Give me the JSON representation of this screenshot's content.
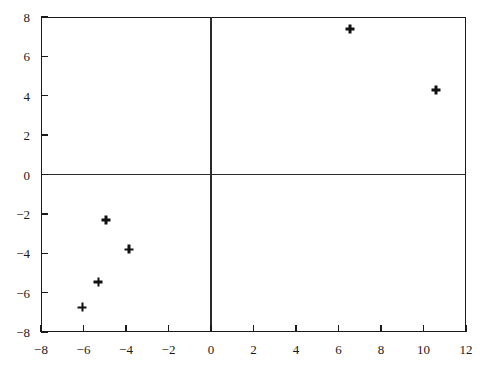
{
  "chart_data": {
    "type": "scatter",
    "title": "",
    "xlabel": "",
    "ylabel": "",
    "xlim": [
      -8,
      12
    ],
    "ylim": [
      -8,
      8
    ],
    "grid": false,
    "legend": null,
    "marker": "plus",
    "marker_color": "#111111",
    "axis_color": "#1a1a1a",
    "background": "#ffffff",
    "xticks": [
      -8,
      -6,
      -4,
      -2,
      0,
      2,
      4,
      6,
      8,
      10,
      12
    ],
    "yticks": [
      8,
      6,
      4,
      2,
      0,
      -2,
      -4,
      -6,
      -8
    ],
    "xtick_labels": [
      "−8",
      "−6",
      "−4",
      "−2",
      "0",
      "2",
      "4",
      "6",
      "8",
      "10",
      "12"
    ],
    "ytick_labels": [
      "8",
      "6",
      "4",
      "2",
      "0",
      "−2",
      "−4",
      "−6",
      "−8"
    ],
    "zero_axes": true,
    "points": [
      {
        "x": 6.55,
        "y": 7.4
      },
      {
        "x": 10.6,
        "y": 4.3
      },
      {
        "x": -4.95,
        "y": -2.3
      },
      {
        "x": -3.85,
        "y": -3.8
      },
      {
        "x": -5.3,
        "y": -5.45
      },
      {
        "x": -6.05,
        "y": -6.75
      }
    ]
  }
}
